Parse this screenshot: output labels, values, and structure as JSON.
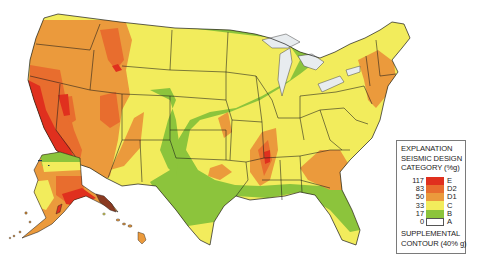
{
  "map": {
    "subject": "United States seismic design categories",
    "regions_shown": [
      "Contiguous United States",
      "Alaska",
      "Hawaii"
    ],
    "colors": {
      "E": "#e0301e",
      "D2": "#e86d2e",
      "D1": "#eb9a3c",
      "C": "#f2ec5c",
      "B": "#8cc43c",
      "A": "#ffffff",
      "water": "#e8ecef",
      "state_lines": "#1a1a1a"
    }
  },
  "legend": {
    "title_line1": "EXPLANATION",
    "title_line2": "SEISMIC DESIGN",
    "title_line3": "CATEGORY (%g)",
    "items": [
      {
        "value": "117",
        "category": "E",
        "color": "#e0301e"
      },
      {
        "value": "83",
        "category": "D2",
        "color": "#e86d2e"
      },
      {
        "value": "50",
        "category": "D1",
        "color": "#eb9a3c"
      },
      {
        "value": "33",
        "category": "C",
        "color": "#f2ec5c"
      },
      {
        "value": "17",
        "category": "B",
        "color": "#8cc43c"
      },
      {
        "value": "0",
        "category": "A",
        "color": "#ffffff"
      }
    ],
    "footer_line1": "SUPPLEMENTAL",
    "footer_line2": "CONTOUR (40% g)"
  }
}
